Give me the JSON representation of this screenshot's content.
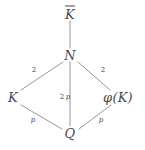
{
  "figure": {
    "type": "lattice-diagram",
    "background_color": "#ffffff",
    "line_color": "#8a8a8a",
    "text_color": "#4a4a4a"
  },
  "nodes": [
    {
      "id": "Kbar",
      "label": "K",
      "overline": true,
      "x": 70,
      "y": 13,
      "name": "node-k-bar"
    },
    {
      "id": "N",
      "label": "N",
      "overline": false,
      "x": 70,
      "y": 55,
      "name": "node-n"
    },
    {
      "id": "K",
      "label": "K",
      "overline": false,
      "x": 13,
      "y": 97,
      "name": "node-k"
    },
    {
      "id": "phiK",
      "label": "φ(K)",
      "overline": false,
      "x": 118,
      "y": 97,
      "name": "node-phi-k"
    },
    {
      "id": "Q",
      "label": "Q",
      "overline": false,
      "x": 70,
      "y": 133,
      "name": "node-q"
    }
  ],
  "edges": [
    {
      "id": "e-kbar-n",
      "from": "Kbar",
      "to": "N",
      "label": "",
      "name": "edge-kbar-n"
    },
    {
      "id": "e-n-k",
      "from": "N",
      "to": "K",
      "label": "2",
      "label_x": 34,
      "label_y": 70,
      "name": "edge-n-k"
    },
    {
      "id": "e-n-phik",
      "from": "N",
      "to": "phiK",
      "label": "2",
      "label_x": 103,
      "label_y": 70,
      "name": "edge-n-phik"
    },
    {
      "id": "e-n-q",
      "from": "N",
      "to": "Q",
      "label": "2p",
      "label_x": 65,
      "label_y": 97,
      "name": "edge-n-q"
    },
    {
      "id": "e-k-q",
      "from": "K",
      "to": "Q",
      "label": "p",
      "label_x": 33,
      "label_y": 120,
      "name": "edge-k-q"
    },
    {
      "id": "e-phik-q",
      "from": "phiK",
      "to": "Q",
      "label": "p",
      "label_x": 101,
      "label_y": 120,
      "name": "edge-phik-q"
    }
  ],
  "edge_labels": {
    "n_k": "2",
    "n_phik": "2",
    "n_q_mult": "2",
    "n_q_var": "p",
    "k_q": "p",
    "phik_q": "p"
  },
  "node_labels": {
    "kbar": "K",
    "n": "N",
    "k": "K",
    "phik_prefix": "φ(",
    "phik_inner": "K",
    "phik_suffix": ")",
    "q": "Q"
  }
}
